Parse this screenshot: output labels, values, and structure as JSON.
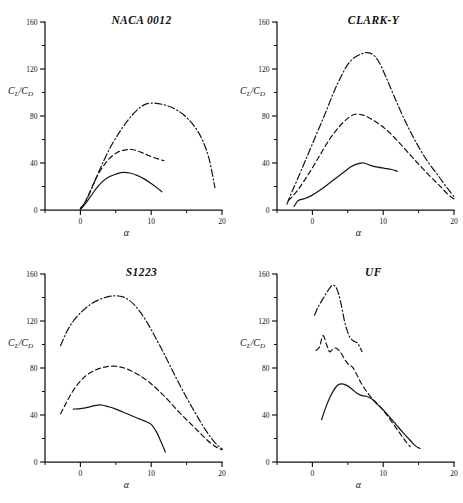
{
  "figure": {
    "axis_label_y_numerator": "C",
    "axis_label_y_numerator_sub": "L",
    "axis_label_y_slash": "/",
    "axis_label_y_denominator": "C",
    "axis_label_y_denominator_sub": "D",
    "axis_label_x": "α",
    "ink_color": "#141414",
    "background_color": "#ffffff"
  },
  "chart_data": [
    {
      "type": "line",
      "title": "NACA 0012",
      "xlabel": "α",
      "ylabel": "CL/CD",
      "xlim": [
        -5,
        20
      ],
      "ylim": [
        0,
        160
      ],
      "xticks": [
        0,
        10,
        20
      ],
      "xtick_labels": [
        "0",
        "10",
        "20"
      ],
      "xticks_minor": [
        -5,
        5,
        15
      ],
      "yticks": [
        0,
        40,
        80,
        120,
        160
      ],
      "ytick_labels": [
        "0",
        "40",
        "80",
        "120",
        "160"
      ],
      "yticks_minor": [
        20,
        60,
        100,
        140
      ],
      "grid": false,
      "legend": "none",
      "series": [
        {
          "name": "solid",
          "style": "solid",
          "x": [
            0.0,
            0.4,
            0.9,
            1.5,
            2.2,
            3.0,
            4.0,
            5.0,
            6.0,
            7.0,
            8.0,
            9.0,
            10.0,
            11.0,
            11.5
          ],
          "y": [
            0.5,
            3.0,
            7.0,
            12.0,
            18.0,
            23.5,
            28.0,
            30.5,
            32.0,
            31.5,
            29.5,
            26.5,
            22.5,
            18.0,
            15.5
          ]
        },
        {
          "name": "dashed",
          "style": "dashed",
          "x": [
            0.0,
            0.5,
            1.0,
            1.6,
            2.3,
            3.2,
            4.2,
            5.2,
            6.2,
            7.2,
            8.2,
            9.2,
            10.2,
            11.2,
            11.8
          ],
          "y": [
            1.0,
            5.0,
            11.0,
            19.0,
            28.0,
            37.0,
            44.5,
            49.0,
            51.0,
            51.5,
            50.0,
            47.5,
            45.0,
            43.0,
            42.0
          ]
        },
        {
          "name": "dashdot",
          "style": "dashdot",
          "x": [
            0.0,
            0.6,
            1.2,
            2.0,
            3.0,
            4.2,
            5.5,
            6.8,
            8.0,
            9.0,
            10.0,
            11.5,
            13.0,
            14.5,
            16.0,
            17.2,
            18.2,
            19.0
          ],
          "y": [
            1.5,
            6.0,
            13.0,
            24.0,
            38.0,
            53.0,
            66.0,
            77.0,
            85.0,
            89.5,
            91.0,
            90.0,
            87.0,
            81.5,
            72.0,
            60.0,
            43.0,
            19.0
          ]
        }
      ]
    },
    {
      "type": "line",
      "title": "CLARK-Y",
      "xlabel": "α",
      "ylabel": "CL/CD",
      "xlim": [
        -5,
        20
      ],
      "ylim": [
        0,
        160
      ],
      "xticks": [
        0,
        10,
        20
      ],
      "xtick_labels": [
        "0",
        "10",
        "20"
      ],
      "xticks_minor": [
        -5,
        5,
        15
      ],
      "yticks": [
        0,
        40,
        80,
        120,
        160
      ],
      "ytick_labels": [
        "0",
        "40",
        "80",
        "120",
        "160"
      ],
      "yticks_minor": [
        20,
        60,
        100,
        140
      ],
      "grid": false,
      "legend": "none",
      "series": [
        {
          "name": "solid",
          "style": "solid",
          "x": [
            -2.6,
            -2.0,
            -1.2,
            -0.2,
            1.0,
            2.2,
            3.4,
            4.5,
            5.5,
            6.5,
            7.3,
            8.2,
            9.2,
            10.2,
            11.2,
            12.0
          ],
          "y": [
            3.0,
            8.0,
            9.5,
            12.0,
            16.5,
            22.0,
            27.5,
            32.5,
            37.0,
            39.5,
            40.0,
            38.0,
            36.5,
            35.5,
            34.5,
            33.0
          ]
        },
        {
          "name": "dashed",
          "style": "dashed",
          "x": [
            -3.4,
            -2.6,
            -1.6,
            -0.4,
            1.0,
            2.4,
            3.8,
            5.0,
            6.0,
            7.0,
            8.0,
            9.2,
            10.5,
            12.0,
            13.5,
            15.0,
            16.5,
            18.0,
            19.2,
            20.0
          ],
          "y": [
            8.0,
            13.0,
            21.0,
            32.0,
            46.0,
            60.0,
            71.0,
            78.0,
            81.5,
            81.0,
            78.5,
            74.0,
            68.0,
            59.0,
            49.0,
            39.0,
            29.5,
            20.5,
            13.0,
            9.5
          ]
        },
        {
          "name": "dashdot",
          "style": "dashdot",
          "x": [
            -3.6,
            -3.0,
            -2.2,
            -1.0,
            0.4,
            1.8,
            3.0,
            4.0,
            5.0,
            6.0,
            7.0,
            7.8,
            8.6,
            9.4,
            10.4,
            11.6,
            13.0,
            14.6,
            16.2,
            17.8,
            19.0,
            20.0
          ],
          "y": [
            5.0,
            14.0,
            25.0,
            42.0,
            62.0,
            82.0,
            100.0,
            113.0,
            124.0,
            130.0,
            133.0,
            134.0,
            132.0,
            126.0,
            113.0,
            96.0,
            77.0,
            58.0,
            42.0,
            29.0,
            19.0,
            11.5
          ]
        }
      ]
    },
    {
      "type": "line",
      "title": "S1223",
      "xlabel": "α",
      "ylabel": "CL/CD",
      "xlim": [
        -5,
        20
      ],
      "ylim": [
        0,
        160
      ],
      "xticks": [
        0,
        10,
        20
      ],
      "xtick_labels": [
        "0",
        "10",
        "20"
      ],
      "xticks_minor": [
        -5,
        5,
        15
      ],
      "yticks": [
        0,
        40,
        80,
        120,
        160
      ],
      "ytick_labels": [
        "0",
        "40",
        "80",
        "120",
        "160"
      ],
      "yticks_minor": [
        20,
        60,
        100,
        140
      ],
      "grid": false,
      "legend": "none",
      "series": [
        {
          "name": "solid",
          "style": "solid",
          "x": [
            -1.0,
            0.0,
            1.0,
            2.0,
            3.0,
            4.0,
            5.0,
            6.0,
            7.0,
            8.0,
            9.0,
            10.0,
            10.8,
            11.4,
            12.0
          ],
          "y": [
            45.0,
            45.5,
            46.5,
            48.0,
            48.5,
            47.0,
            45.0,
            42.5,
            40.0,
            37.5,
            35.0,
            32.0,
            25.0,
            17.0,
            8.5
          ]
        },
        {
          "name": "dashed",
          "style": "dashed",
          "x": [
            -2.8,
            -2.2,
            -1.4,
            -0.4,
            0.8,
            2.2,
            3.6,
            5.0,
            6.2,
            7.2,
            8.4,
            9.6,
            11.0,
            12.5,
            14.0,
            15.5,
            17.0,
            18.4,
            19.4,
            20.0
          ],
          "y": [
            41.0,
            48.0,
            57.0,
            66.0,
            73.5,
            78.5,
            81.0,
            81.5,
            80.0,
            77.5,
            73.5,
            68.5,
            61.0,
            52.0,
            42.0,
            33.0,
            24.0,
            16.0,
            12.0,
            10.5
          ]
        },
        {
          "name": "dashdot",
          "style": "dashdot",
          "x": [
            -2.8,
            -2.0,
            -1.0,
            0.2,
            1.4,
            2.6,
            3.8,
            5.0,
            6.0,
            6.8,
            7.6,
            8.4,
            9.4,
            10.6,
            12.0,
            13.4,
            14.8,
            16.2,
            17.6,
            18.8,
            19.6,
            20.0
          ],
          "y": [
            99.0,
            110.0,
            120.0,
            128.0,
            134.0,
            138.0,
            140.5,
            141.5,
            140.5,
            138.0,
            134.0,
            128.0,
            119.0,
            106.0,
            90.0,
            73.0,
            57.0,
            42.0,
            28.0,
            18.0,
            13.0,
            11.0
          ]
        }
      ]
    },
    {
      "type": "line",
      "title": "UF",
      "xlabel": "α",
      "ylabel": "CL/CD",
      "xlim": [
        -5,
        20
      ],
      "ylim": [
        0,
        160
      ],
      "xticks": [
        0,
        10,
        20
      ],
      "xtick_labels": [
        "0",
        "10",
        "20"
      ],
      "xticks_minor": [
        -5,
        5,
        15
      ],
      "yticks": [
        0,
        40,
        80,
        120,
        160
      ],
      "ytick_labels": [
        "0",
        "40",
        "80",
        "120",
        "160"
      ],
      "yticks_minor": [
        20,
        60,
        100,
        140
      ],
      "grid": false,
      "legend": "none",
      "series": [
        {
          "name": "solid",
          "style": "solid",
          "x": [
            1.3,
            1.8,
            2.4,
            3.0,
            3.6,
            4.2,
            4.9,
            5.6,
            6.3,
            7.0,
            7.6,
            8.3,
            9.0,
            9.8,
            10.8,
            11.8,
            12.8,
            13.8,
            14.6,
            15.2
          ],
          "y": [
            36.0,
            45.0,
            54.0,
            61.0,
            65.5,
            66.5,
            65.0,
            62.0,
            58.5,
            56.5,
            56.0,
            54.0,
            50.0,
            45.5,
            39.0,
            32.0,
            25.0,
            18.5,
            13.5,
            11.5
          ]
        },
        {
          "name": "dashed",
          "style": "dashed",
          "x": [
            0.5,
            1.0,
            1.5,
            2.0,
            2.4,
            2.8,
            3.3,
            3.9,
            4.5,
            5.1,
            5.7,
            6.3,
            6.9,
            7.6,
            8.3,
            9.1,
            10.0,
            11.0,
            12.0,
            13.0,
            13.8
          ],
          "y": [
            95.0,
            98.0,
            107.5,
            100.0,
            94.0,
            95.5,
            97.0,
            94.0,
            88.0,
            83.0,
            80.5,
            74.0,
            67.0,
            60.5,
            55.0,
            50.0,
            44.0,
            36.0,
            27.5,
            19.0,
            13.0
          ]
        },
        {
          "name": "dashdot",
          "style": "dashdot",
          "x": [
            0.3,
            0.9,
            1.5,
            2.0,
            2.5,
            2.9,
            3.3,
            3.7,
            4.1,
            4.5,
            4.9,
            5.3,
            5.8,
            6.4,
            7.0
          ],
          "y": [
            125.0,
            133.0,
            139.0,
            144.0,
            148.5,
            150.5,
            149.0,
            143.0,
            133.0,
            121.0,
            112.0,
            106.0,
            103.0,
            101.0,
            94.0
          ]
        }
      ]
    }
  ]
}
